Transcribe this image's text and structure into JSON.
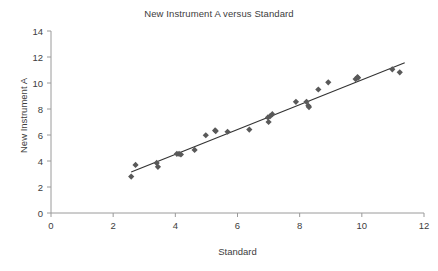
{
  "chart_data": {
    "type": "scatter",
    "title": "New Instrument A versus Standard",
    "xlabel": "Standard",
    "ylabel": "New Instrument A",
    "xlim": [
      0,
      12
    ],
    "ylim": [
      0,
      14
    ],
    "xticks": [
      0,
      2,
      4,
      6,
      8,
      10,
      12
    ],
    "yticks": [
      0,
      2,
      4,
      6,
      8,
      10,
      12,
      14
    ],
    "grid": false,
    "legend": "none",
    "marker": "diamond",
    "marker_color": "#595959",
    "line_color": "#333333",
    "series": [
      {
        "name": "New Instrument A vs Standard",
        "points": [
          [
            2.58,
            2.8
          ],
          [
            2.72,
            3.7
          ],
          [
            3.4,
            3.85
          ],
          [
            3.44,
            3.55
          ],
          [
            4.05,
            4.55
          ],
          [
            4.12,
            4.55
          ],
          [
            4.18,
            4.5
          ],
          [
            4.62,
            4.85
          ],
          [
            4.98,
            5.98
          ],
          [
            5.28,
            6.35
          ],
          [
            5.3,
            6.3
          ],
          [
            5.68,
            6.25
          ],
          [
            6.38,
            6.42
          ],
          [
            6.98,
            7.35
          ],
          [
            7.0,
            7.0
          ],
          [
            7.05,
            7.45
          ],
          [
            7.12,
            7.6
          ],
          [
            7.88,
            8.55
          ],
          [
            8.22,
            8.55
          ],
          [
            8.28,
            8.25
          ],
          [
            8.3,
            8.15
          ],
          [
            8.6,
            9.5
          ],
          [
            8.92,
            10.05
          ],
          [
            9.8,
            10.3
          ],
          [
            9.86,
            10.45
          ],
          [
            9.88,
            10.4
          ],
          [
            10.98,
            11.05
          ],
          [
            11.22,
            10.82
          ]
        ]
      }
    ],
    "trendline": {
      "x0": 2.58,
      "y0": 3.15,
      "x1": 11.38,
      "y1": 11.55
    }
  }
}
